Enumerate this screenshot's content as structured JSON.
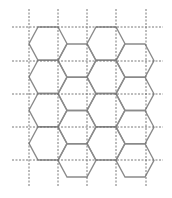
{
  "diagram": {
    "title": "",
    "canvas": {
      "width": 172,
      "height": 198,
      "background": "#ffffff"
    },
    "colors": {
      "grid_line": "#6a6a6a",
      "hex_stroke": "#8a8a8a"
    },
    "grid": {
      "style": "dashed",
      "vertical_lines": {
        "x": [
          29,
          58,
          87,
          116,
          146
        ],
        "y_start": 9,
        "y_end": 186
      },
      "horizontal_lines": {
        "y": [
          27,
          61,
          94,
          127,
          160
        ],
        "x_start": 12,
        "x_end": 163
      }
    },
    "hex_tiling": {
      "orientation": "flat-top",
      "hex_width": 38,
      "hex_height": 33.25,
      "top_edge_inset": 9,
      "columns": [
        {
          "x_left": 29,
          "y_top": 27,
          "rows": 4
        },
        {
          "x_left": 58,
          "y_top": 44,
          "rows": 4
        },
        {
          "x_left": 87,
          "y_top": 27,
          "rows": 4
        },
        {
          "x_left": 116,
          "y_top": 44,
          "rows": 4
        }
      ]
    }
  }
}
